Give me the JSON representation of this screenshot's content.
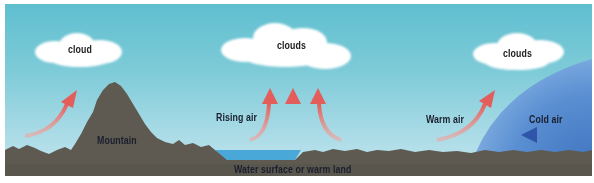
{
  "diagram": {
    "panels": [
      {
        "id": "orographic",
        "cloud_label": "cloud",
        "terrain_label": "Mountain"
      },
      {
        "id": "convection",
        "cloud_label": "clouds",
        "air_label": "Rising air",
        "surface_label": "Water surface or warm land"
      },
      {
        "id": "frontal",
        "cloud_label": "clouds",
        "warm_label": "Warm air",
        "cold_label": "Cold air"
      }
    ],
    "colors": {
      "sky_top": "#5fbfcf",
      "sky_bottom": "#c4e6ee",
      "ground": "#5e5a52",
      "water": "#4aa8d8",
      "warm_arrow": "#e8716a",
      "cold_air_mass": "#4a82c8",
      "cold_arrow": "#3a5fb0",
      "cloud": "#ffffff"
    }
  }
}
